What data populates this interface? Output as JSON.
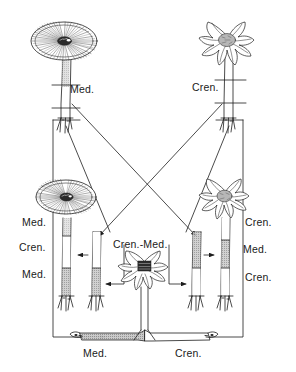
{
  "figure": {
    "line_color": "#1d1d1d",
    "fill_medium": "#b6b6b6",
    "fill_crenate": "#ffffff",
    "background": "#ffffff"
  },
  "labels": {
    "top_left_stock": "Med.",
    "top_right_stock": "Cren.",
    "mid_left_upper": "Med.",
    "mid_left_middle": "Cren.",
    "mid_left_lower": "Med.",
    "mid_left_cutting_note": "Cren.-Med.",
    "mid_right_upper": "Cren.",
    "mid_right_middle": "Med.",
    "mid_right_lower": "Cren.",
    "bottom_left_rhizome": "Med.",
    "bottom_right_rhizome": "Cren."
  },
  "plants": {
    "top_left": {
      "name": "medium-plant-top-left",
      "flower_type": "flat-rayed-disc",
      "label": "Med.",
      "graft_marks": 2
    },
    "top_right": {
      "name": "crenate-plant-top-right",
      "flower_type": "ruffled-full",
      "label": "Cren.",
      "graft_marks": 2
    },
    "mid_left": {
      "name": "medium-plant-mid-left",
      "flower_type": "flat-rayed-disc",
      "segments": [
        "Med.",
        "Cren.",
        "Med."
      ]
    },
    "mid_right": {
      "name": "crenate-plant-mid-right",
      "flower_type": "ruffled-full",
      "segments": [
        "Cren.",
        "Med.",
        "Cren."
      ]
    },
    "center_bottom": {
      "name": "chimera-plant-center",
      "flower_type": "ruffled-full",
      "label": "Cren.-Med."
    }
  },
  "cuttings": {
    "left": {
      "name": "cutting-left",
      "upper_fill": "white",
      "lower_fill": "gray"
    },
    "right": {
      "name": "cutting-right",
      "upper_fill": "gray",
      "lower_fill": "white"
    }
  },
  "rhizome": {
    "name": "horizontal-rhizome",
    "left_section_label": "Med.",
    "right_section_label": "Cren.",
    "left_fill": "gray",
    "right_fill": "white"
  },
  "connectors": {
    "diagonal_top_left_to_mid_right": "Med. stock crosses to right cutting",
    "diagonal_top_right_to_mid_left": "Cren. stock crosses to left cutting",
    "frame_left": "left return path to rhizome",
    "frame_right": "right return path to rhizome",
    "arrow_left_cutting_to_plant": "cutting grafted onto mid-left plant",
    "arrow_right_cutting_to_plant": "cutting grafted onto mid-right plant"
  }
}
